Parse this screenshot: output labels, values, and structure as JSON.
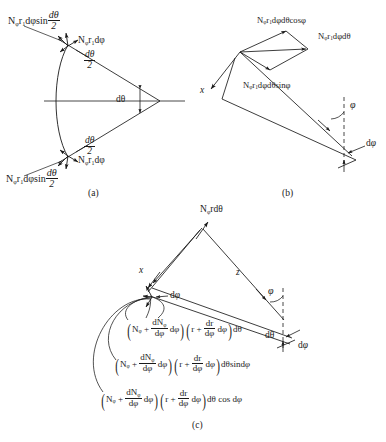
{
  "figure": {
    "panels": [
      {
        "id": "a",
        "caption": "(a)",
        "labels": {
          "top_outer": "Nφr₁dφ sin(dθ/2)",
          "top_inner": "Nφr₁dφ",
          "top_angle": "dθ/2",
          "center_angle": "dθ",
          "bottom_angle": "dθ/2",
          "bottom_inner": "Nφr₁dφ",
          "bottom_outer": "Nφr₁dφ sin(dθ/2)"
        }
      },
      {
        "id": "b",
        "caption": "(b)",
        "labels": {
          "top": "Nφr₁dφdθ cosφ",
          "right": "Nφr₁dφdθ",
          "middle": "Nφr₁dφdθ sinφ",
          "axis_x": "x",
          "angle_phi": "φ",
          "angle_dphi": "dφ"
        }
      },
      {
        "id": "c",
        "caption": "(c)",
        "labels": {
          "top": "Nφr dθ",
          "axis_x": "x",
          "axis_z": "z",
          "dphi_left": "dφ",
          "angle_phi": "φ",
          "angle_dtheta": "dθ",
          "angle_dphi": "dφ"
        },
        "formulas": [
          {
            "id": "formula-1",
            "N_sym": "N",
            "N_sub": "φ",
            "dN_num": "dN",
            "dN_num_sub": "φ",
            "dN_den": "dφ",
            "dphi": "dφ",
            "r_sym": "r",
            "dr_num": "dr",
            "dr_den": "dφ",
            "tail": "dθ"
          },
          {
            "id": "formula-2",
            "N_sym": "N",
            "N_sub": "φ",
            "dN_num": "dN",
            "dN_num_sub": "φ",
            "dN_den": "dφ",
            "dphi": "dφ",
            "r_sym": "r",
            "dr_num": "dr",
            "dr_den": "dφ",
            "tail": "dθsindφ"
          },
          {
            "id": "formula-3",
            "N_sym": "N",
            "N_sub": "φ",
            "dN_num": "dN",
            "dN_num_sub": "φ",
            "dN_den": "dφ",
            "dphi": "dφ",
            "r_sym": "r",
            "dr_num": "dr",
            "dr_den": "dφ",
            "tail": "dθ cos dφ"
          }
        ]
      }
    ],
    "colors": {
      "ink": "#1a1a1a",
      "paper": "#ffffff"
    }
  }
}
